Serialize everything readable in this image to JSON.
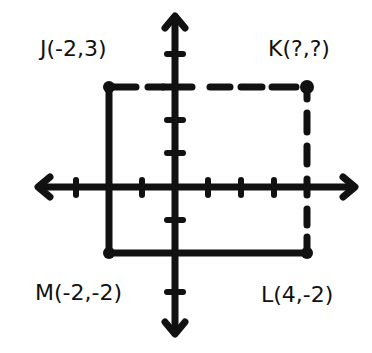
{
  "diagram": {
    "type": "coordinate-plane-rectangle",
    "points": [
      {
        "name": "J",
        "label": "J(-2,3)",
        "x": -2,
        "y": 3
      },
      {
        "name": "K",
        "label": "K(?,?)",
        "x": null,
        "y": null
      },
      {
        "name": "L",
        "label": "L(4,-2)",
        "x": 4,
        "y": -2
      },
      {
        "name": "M",
        "label": "M(-2,-2)",
        "x": -2,
        "y": -2
      }
    ],
    "segments": [
      {
        "from": "J",
        "to": "M",
        "style": "solid"
      },
      {
        "from": "M",
        "to": "L",
        "style": "solid"
      },
      {
        "from": "J",
        "to": "K",
        "style": "dashed"
      },
      {
        "from": "K",
        "to": "L",
        "style": "dashed"
      }
    ],
    "x_ticks": [
      -3,
      -2,
      -1,
      1,
      2,
      3,
      4
    ],
    "y_ticks": [
      4,
      3,
      2,
      1,
      -1,
      -2,
      -3
    ],
    "stroke_color": "#111111",
    "background": "#ffffff"
  },
  "labels": {
    "j": "J(-2,3)",
    "k": "K(?,?)",
    "m": "M(-2,-2)",
    "l": "L(4,-2)"
  }
}
